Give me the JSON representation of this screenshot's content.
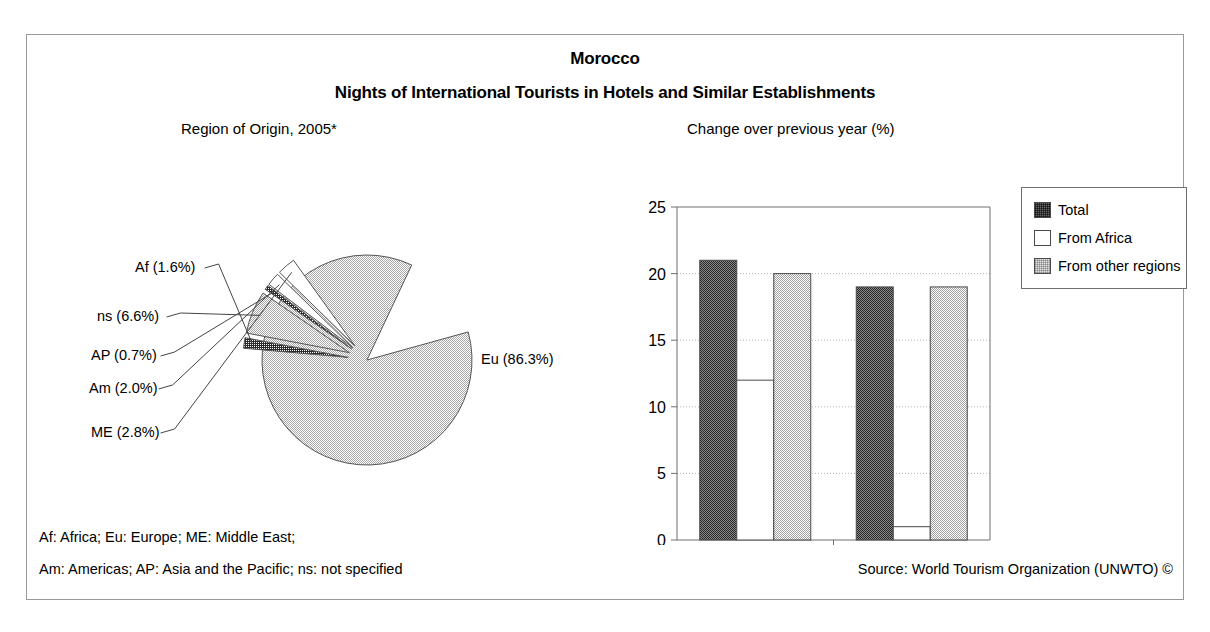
{
  "title": {
    "country": "Morocco",
    "subject": "Nights of International Tourists in Hotels and Similar Establishments"
  },
  "panels": {
    "pie_caption": "Region of Origin, 2005*",
    "bar_caption": "Change over previous year (%)"
  },
  "footnotes": {
    "line1": "Af: Africa; Eu: Europe; ME: Middle East;",
    "line2": "Am: Americas; AP: Asia and the Pacific; ns: not specified",
    "source": "Source: World Tourism Organization (UNWTO) ©"
  },
  "colors": {
    "dark": "#6a6a6a",
    "white": "#ffffff",
    "light": "#e2e2e2",
    "frame": "#999999",
    "axis": "#6f6f6f",
    "grid": "#b5b5b5"
  },
  "chart_data": [
    {
      "type": "pie",
      "title": "Region of Origin, 2005*",
      "labels": [
        "Eu",
        "ns",
        "ME",
        "Am",
        "Af",
        "AP"
      ],
      "label_texts": [
        "Eu (86.3%)",
        "ns (6.6%)",
        "ME (2.8%)",
        "Am (2.0%)",
        "Af (1.6%)",
        "AP (0.7%)"
      ],
      "values": [
        86.3,
        6.6,
        2.8,
        2.0,
        1.6,
        0.7
      ],
      "unit": "%",
      "legend_position": "labels-with-leader-lines",
      "slices": [
        {
          "name": "Eu",
          "label": "Eu (86.3%)",
          "value": 86.3,
          "fill": "light",
          "exploded": false,
          "start_deg": -15.5,
          "sweep_deg": 310.7,
          "label_x": 454,
          "label_y": 219
        },
        {
          "name": "Af",
          "label": "Af (1.6%)",
          "value": 1.6,
          "fill": "dark",
          "exploded": true,
          "start_deg": 185.0,
          "sweep_deg": 5.8,
          "label_x": 108,
          "label_y": 127
        },
        {
          "name": "ns",
          "label": "ns (6.6%)",
          "value": 6.6,
          "fill": "light",
          "exploded": true,
          "start_deg": 190.8,
          "sweep_deg": 23.8,
          "label_x": 70,
          "label_y": 176
        },
        {
          "name": "AP",
          "label": "AP (0.7%)",
          "value": 0.7,
          "fill": "dark",
          "exploded": true,
          "start_deg": 214.6,
          "sweep_deg": 2.5,
          "label_x": 64,
          "label_y": 215
        },
        {
          "name": "Am",
          "label": "Am (2.0%)",
          "value": 2.0,
          "fill": "white",
          "exploded": true,
          "start_deg": 217.1,
          "sweep_deg": 7.2,
          "label_x": 62,
          "label_y": 248
        },
        {
          "name": "ME",
          "label": "ME (2.8%)",
          "value": 2.8,
          "fill": "white",
          "exploded": true,
          "start_deg": 224.3,
          "sweep_deg": 10.1,
          "label_x": 64,
          "label_y": 292
        }
      ]
    },
    {
      "type": "bar",
      "title": "Change over previous year (%)",
      "xlabel": "",
      "ylabel": "",
      "categories": [
        "2004/2003",
        "2005*/2004"
      ],
      "ylim": [
        0,
        25
      ],
      "yticks": [
        0,
        5,
        10,
        15,
        20,
        25
      ],
      "ytick_labels": [
        "0",
        "5",
        "10",
        "15",
        "20",
        "25"
      ],
      "grid": true,
      "legend_position": "right",
      "series": [
        {
          "name": "Total",
          "fill": "dark",
          "values": [
            21,
            19
          ]
        },
        {
          "name": "From Africa",
          "fill": "white",
          "values": [
            12,
            1
          ]
        },
        {
          "name": "From other regions",
          "fill": "light",
          "values": [
            20,
            19
          ]
        }
      ]
    }
  ]
}
